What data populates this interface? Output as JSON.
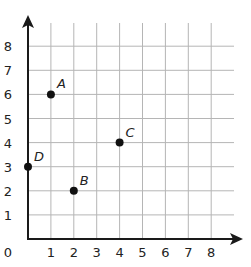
{
  "figure": {
    "type": "coordinate-grid",
    "origin_label": "0",
    "colors": {
      "grid": "#b5b5b5",
      "axis": "#1a1a1a",
      "point": "#111111",
      "text": "#222222"
    }
  },
  "chart_data": {
    "type": "scatter",
    "title": "",
    "xlabel": "",
    "ylabel": "",
    "xlim": [
      0,
      8
    ],
    "ylim": [
      0,
      8
    ],
    "grid": true,
    "x_ticks": [
      "0",
      "1",
      "2",
      "3",
      "4",
      "5",
      "6",
      "7",
      "8"
    ],
    "y_ticks": [
      "1",
      "2",
      "3",
      "4",
      "5",
      "6",
      "7",
      "8"
    ],
    "points": [
      {
        "label": "A",
        "x": 1,
        "y": 6
      },
      {
        "label": "B",
        "x": 2,
        "y": 2
      },
      {
        "label": "C",
        "x": 4,
        "y": 4
      },
      {
        "label": "D",
        "x": 0,
        "y": 3
      }
    ]
  }
}
